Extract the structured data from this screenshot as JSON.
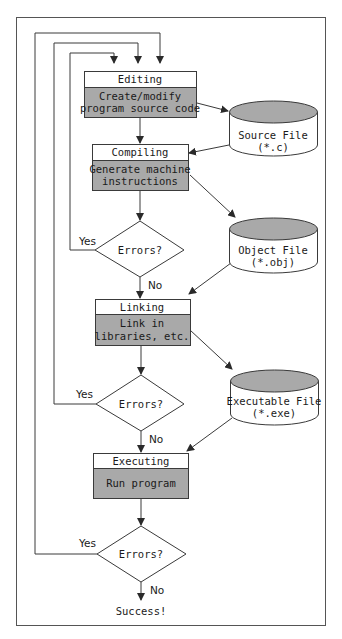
{
  "diagram": {
    "colors": {
      "line": "#3a3a3a",
      "process_fill": "#a9a9a9",
      "header_fill": "#ffffff",
      "cylinder_top": "#a9a9a9",
      "background": "#ffffff"
    },
    "steps": [
      {
        "id": "editing",
        "header": "Editing",
        "body_line1": "Create/modify",
        "body_line2": "program source code"
      },
      {
        "id": "compiling",
        "header": "Compiling",
        "body_line1": "Generate machine",
        "body_line2": "instructions"
      },
      {
        "id": "linking",
        "header": "Linking",
        "body_line1": "Link in",
        "body_line2": "libraries, etc."
      },
      {
        "id": "executing",
        "header": "Executing",
        "body_line1": "Run program",
        "body_line2": ""
      }
    ],
    "files": [
      {
        "id": "source",
        "line1": "Source File",
        "line2": "(*.c)"
      },
      {
        "id": "object",
        "line1": "Object File",
        "line2": "(*.obj)"
      },
      {
        "id": "executable",
        "line1": "Executable File",
        "line2": "(*.exe)"
      }
    ],
    "decisions": [
      {
        "label": "Errors?",
        "yes": "Yes",
        "no": "No"
      },
      {
        "label": "Errors?",
        "yes": "Yes",
        "no": "No"
      },
      {
        "label": "Errors?",
        "yes": "Yes",
        "no": "No"
      }
    ],
    "end_label": "Success!"
  }
}
